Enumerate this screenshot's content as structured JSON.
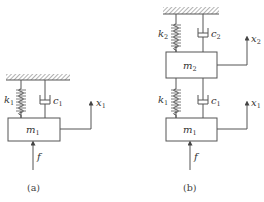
{
  "figure_a": {
    "caption": "(a)",
    "mass": {
      "symbol": "m",
      "sub": "1"
    },
    "spring": {
      "symbol": "k",
      "sub": "1"
    },
    "damper": {
      "symbol": "c",
      "sub": "1"
    },
    "displacement": {
      "symbol": "x",
      "sub": "1"
    },
    "force": {
      "symbol": "f"
    }
  },
  "figure_b": {
    "caption": "(b)",
    "mass_upper": {
      "symbol": "m",
      "sub": "2"
    },
    "mass_lower": {
      "symbol": "m",
      "sub": "1"
    },
    "spring_upper": {
      "symbol": "k",
      "sub": "2"
    },
    "damper_upper": {
      "symbol": "c",
      "sub": "2"
    },
    "spring_lower": {
      "symbol": "k",
      "sub": "1"
    },
    "damper_lower": {
      "symbol": "c",
      "sub": "1"
    },
    "displacement_upper": {
      "symbol": "x",
      "sub": "2"
    },
    "displacement_lower": {
      "symbol": "x",
      "sub": "1"
    },
    "force": {
      "symbol": "f"
    }
  },
  "colors": {
    "stroke": "#555555",
    "text": "#333333"
  }
}
